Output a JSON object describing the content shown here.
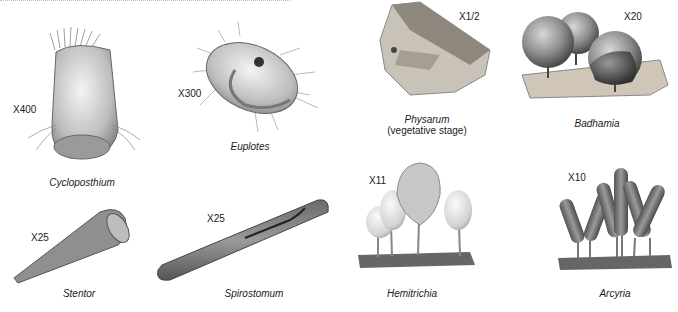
{
  "plate": {
    "organisms": [
      {
        "name": "Cycloposthium",
        "magnification": "X400"
      },
      {
        "name": "Euplotes",
        "magnification": "X300"
      },
      {
        "name": "Physarum",
        "subtitle": "(vegetative stage)",
        "magnification": "X1/2"
      },
      {
        "name": "Badhamia",
        "magnification": "X20"
      },
      {
        "name": "Stentor",
        "magnification": "X25"
      },
      {
        "name": "Spirostomum",
        "magnification": "X25"
      },
      {
        "name": "Hemitrichia",
        "magnification": "X11"
      },
      {
        "name": "Arcyria",
        "magnification": "X10"
      }
    ]
  }
}
